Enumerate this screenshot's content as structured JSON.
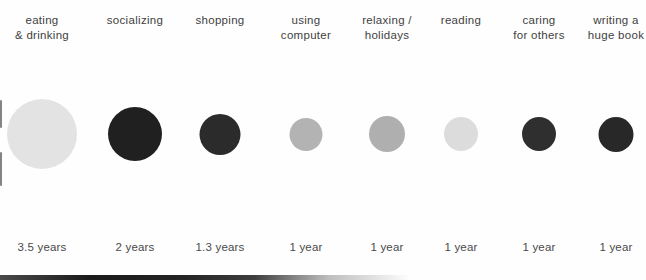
{
  "chart_data": {
    "type": "bubble",
    "title": "",
    "unit": "years",
    "encoding": "circle area proportional to value",
    "background": "#fefefe",
    "categories": [
      "eating & drinking",
      "socializing",
      "shopping",
      "using computer",
      "relaxing / holidays",
      "reading",
      "caring for others",
      "writing a huge book"
    ],
    "values": [
      3.5,
      2,
      1.3,
      1,
      1,
      1,
      1,
      1
    ],
    "value_labels": [
      "3.5 years",
      "2 years",
      "1.3 years",
      "1 year",
      "1 year",
      "1 year",
      "1 year",
      "1 year"
    ],
    "colors": [
      "#e3e3e3",
      "#202020",
      "#2b2b2b",
      "#b3b3b3",
      "#afafaf",
      "#dcdcdc",
      "#2f2f2f",
      "#282828"
    ],
    "bubble_center_y_px": 134,
    "columns": [
      {
        "key": "eating-drinking",
        "label_lines": [
          "eating",
          "& drinking"
        ],
        "value": 3.5,
        "value_label": "3.5 years",
        "color": "#e3e3e3",
        "dark": false,
        "diameter_px": 70,
        "center_x_px": 42
      },
      {
        "key": "socializing",
        "label_lines": [
          "socializing"
        ],
        "value": 2,
        "value_label": "2 years",
        "color": "#202020",
        "dark": true,
        "diameter_px": 54,
        "center_x_px": 135
      },
      {
        "key": "shopping",
        "label_lines": [
          "shopping"
        ],
        "value": 1.3,
        "value_label": "1.3 years",
        "color": "#2b2b2b",
        "dark": true,
        "diameter_px": 41,
        "center_x_px": 220
      },
      {
        "key": "using-computer",
        "label_lines": [
          "using",
          "computer"
        ],
        "value": 1,
        "value_label": "1 year",
        "color": "#b3b3b3",
        "dark": false,
        "diameter_px": 33,
        "center_x_px": 306
      },
      {
        "key": "relaxing-holidays",
        "label_lines": [
          "relaxing /",
          "holidays"
        ],
        "value": 1,
        "value_label": "1 year",
        "color": "#afafaf",
        "dark": false,
        "diameter_px": 36,
        "center_x_px": 387
      },
      {
        "key": "reading",
        "label_lines": [
          "reading"
        ],
        "value": 1,
        "value_label": "1 year",
        "color": "#dcdcdc",
        "dark": false,
        "diameter_px": 34,
        "center_x_px": 461
      },
      {
        "key": "caring-for-others",
        "label_lines": [
          "caring",
          "for others"
        ],
        "value": 1,
        "value_label": "1 year",
        "color": "#2f2f2f",
        "dark": true,
        "diameter_px": 34,
        "center_x_px": 539
      },
      {
        "key": "writing-huge-book",
        "label_lines": [
          "writing a",
          "huge book"
        ],
        "value": 1,
        "value_label": "1 year",
        "color": "#282828",
        "dark": true,
        "diameter_px": 35,
        "center_x_px": 616
      }
    ]
  }
}
